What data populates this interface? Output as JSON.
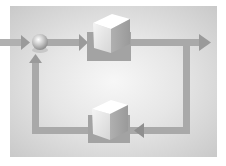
{
  "diagram": {
    "type": "feedback-control-loop",
    "nodes": [
      {
        "id": "summing-junction",
        "shape": "sphere"
      },
      {
        "id": "forward-block",
        "shape": "cube"
      },
      {
        "id": "feedback-block",
        "shape": "cube"
      }
    ],
    "edges": [
      {
        "from": "input",
        "to": "summing-junction"
      },
      {
        "from": "summing-junction",
        "to": "forward-block"
      },
      {
        "from": "forward-block",
        "to": "output"
      },
      {
        "from": "output",
        "to": "feedback-block"
      },
      {
        "from": "feedback-block",
        "to": "summing-junction"
      }
    ],
    "colors": {
      "background_center": "#f7f7f7",
      "background_edge": "#c9c9c9",
      "line": "#a9a9a9",
      "arrowhead": "#9a9a9a",
      "cube_top": "#ffffff",
      "cube_front": "#e8e8e8",
      "cube_side": "#a8a8a8",
      "block_shadow": "#a0a0a0"
    }
  }
}
